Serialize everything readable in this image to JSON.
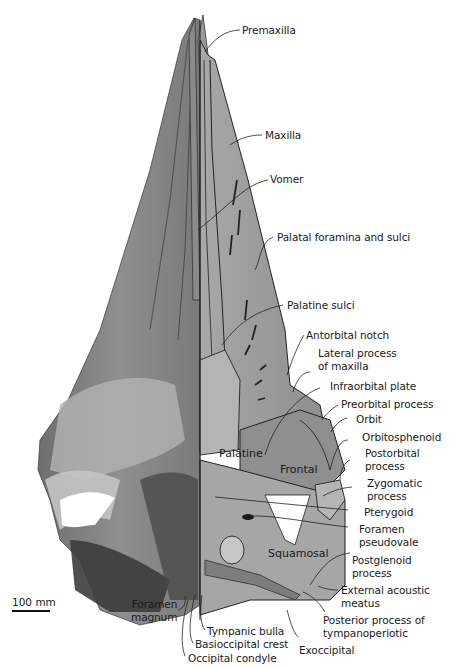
{
  "figure": {
    "scale_bar": {
      "label": "100 mm"
    },
    "inside_labels": {
      "palatine": "Palatine",
      "frontal": "Frontal",
      "squamosal": "Squamosal"
    },
    "labels": {
      "premaxilla": "Premaxilla",
      "maxilla": "Maxilla",
      "vomer": "Vomer",
      "palatal_foramina": "Palatal foramina and sulci",
      "palatine_sulci": "Palatine sulci",
      "antorbital_notch": "Antorbital notch",
      "lateral_process": "Lateral process\nof maxilla",
      "infraorbital_plate": "Infraorbital plate",
      "preorbital_process": "Preorbital process",
      "orbit": "Orbit",
      "orbitosphenoid": "Orbitosphenoid",
      "postorbital_process": "Postorbital\nprocess",
      "zygomatic_process": "Zygomatic\nprocess",
      "pterygoid": "Pterygoid",
      "foramen_pseudovale": "Foramen\npseudovale",
      "postglenoid_process": "Postglenoid\nprocess",
      "external_acoustic_meatus": "External acoustic\nmeatus",
      "posterior_process": "Posterior process of\ntympanoperiotic",
      "exoccipital": "Exoccipital",
      "foramen_magnum": "Foramen\nmagnum",
      "tympanic_bulla": "Tympanic bulla",
      "basioccipital_crest": "Basioccipital crest",
      "occipital_condyle": "Occipital condyle"
    },
    "colors": {
      "photo_dark": "#5a5a5a",
      "photo_mid": "#8c8c8c",
      "photo_light": "#b4b4b4",
      "illus_fill": "#9c9c9c",
      "illus_light": "#bdbdbd",
      "line": "#222222"
    }
  }
}
